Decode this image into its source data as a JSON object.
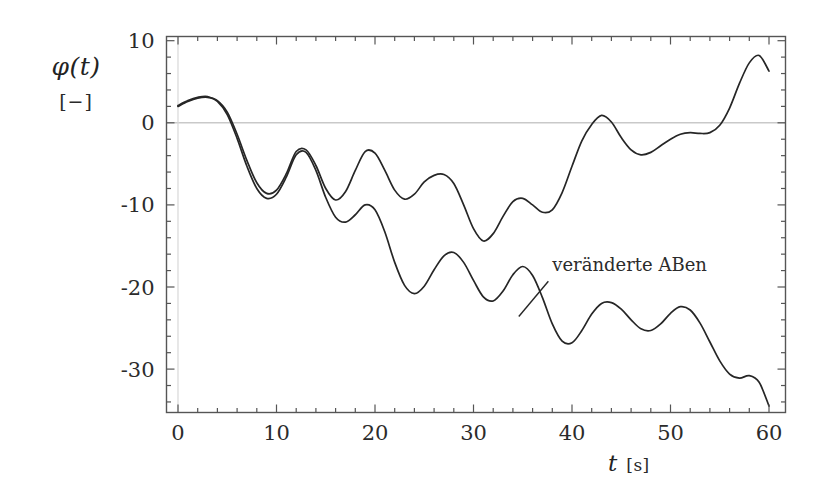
{
  "chart_data": {
    "type": "line",
    "title": "",
    "xlabel": "t",
    "xunits": "[s]",
    "ylabel": "φ(t)",
    "yunits": "[−]",
    "xlim": [
      0,
      60
    ],
    "ylim": [
      -36,
      10
    ],
    "xticks": [
      0,
      10,
      20,
      30,
      40,
      50,
      60
    ],
    "xtick_labels": [
      "0",
      "10",
      "20",
      "30",
      "40",
      "50",
      "60"
    ],
    "xminor_step": 2,
    "yticks": [
      10,
      0,
      -10,
      -20,
      -30
    ],
    "ytick_labels": [
      "10",
      "0",
      "-10",
      "-20",
      "-30"
    ],
    "yminor_step": 2,
    "grid": false,
    "zero_line": true,
    "legend_position": "none",
    "line_color": "#262626",
    "zero_line_color": "#c9c9c9",
    "frame_color": "#555555",
    "annotations": [
      {
        "text": "veränderte ABen",
        "text_x": 38.0,
        "text_y": -18.1,
        "leader_from_x": 37.6,
        "leader_from_y": -19.3,
        "leader_to_x": 34.6,
        "leader_to_y": -23.6
      }
    ],
    "series": [
      {
        "name": "original",
        "x": [
          0,
          1,
          2,
          3,
          4,
          5,
          6,
          7,
          8,
          9,
          10,
          11,
          12,
          13,
          14,
          15,
          16,
          17,
          18,
          19,
          20,
          21,
          22,
          23,
          24,
          25,
          26,
          27,
          28,
          29,
          30,
          31,
          32,
          33,
          34,
          35,
          36,
          37,
          38,
          39,
          40,
          41,
          42,
          43,
          44,
          45,
          46,
          47,
          48,
          49,
          50,
          51,
          52,
          53,
          54,
          55,
          56,
          57,
          58,
          59,
          60
        ],
        "y": [
          2.0,
          2.6,
          3.0,
          3.1,
          2.7,
          1.3,
          -1.4,
          -4.6,
          -7.3,
          -8.6,
          -8.2,
          -6.2,
          -3.5,
          -3.3,
          -5.2,
          -8.0,
          -9.4,
          -8.4,
          -5.8,
          -3.5,
          -3.7,
          -5.8,
          -8.2,
          -9.3,
          -8.7,
          -7.2,
          -6.4,
          -6.3,
          -7.4,
          -10.0,
          -12.9,
          -14.4,
          -13.5,
          -11.4,
          -9.6,
          -9.2,
          -10.0,
          -10.9,
          -10.6,
          -8.5,
          -5.3,
          -2.2,
          -0.2,
          0.9,
          0.1,
          -1.8,
          -3.3,
          -3.9,
          -3.6,
          -2.8,
          -2.0,
          -1.4,
          -1.2,
          -1.3,
          -1.2,
          -0.3,
          1.8,
          4.8,
          7.3,
          8.2,
          6.3
        ]
      },
      {
        "name": "veränderte ABen",
        "x": [
          0,
          1,
          2,
          3,
          4,
          5,
          6,
          7,
          8,
          9,
          10,
          11,
          12,
          13,
          14,
          15,
          16,
          17,
          18,
          19,
          20,
          21,
          22,
          23,
          24,
          25,
          26,
          27,
          28,
          29,
          30,
          31,
          32,
          33,
          34,
          35,
          36,
          37,
          38,
          39,
          40,
          41,
          42,
          43,
          44,
          45,
          46,
          47,
          48,
          49,
          50,
          51,
          52,
          53,
          54,
          55,
          56,
          57,
          58,
          59,
          60
        ],
        "y": [
          2.1,
          2.7,
          3.1,
          3.2,
          2.6,
          1.0,
          -1.9,
          -5.3,
          -8.0,
          -9.2,
          -8.7,
          -6.6,
          -3.9,
          -3.6,
          -5.8,
          -9.1,
          -11.5,
          -12.1,
          -11.2,
          -10.0,
          -10.6,
          -13.3,
          -17.0,
          -19.8,
          -20.8,
          -19.9,
          -17.9,
          -16.2,
          -15.8,
          -17.0,
          -19.2,
          -21.2,
          -21.7,
          -20.5,
          -18.5,
          -17.5,
          -18.6,
          -21.3,
          -24.5,
          -26.6,
          -26.8,
          -25.3,
          -23.3,
          -22.0,
          -21.9,
          -22.7,
          -24.0,
          -25.1,
          -25.3,
          -24.5,
          -23.2,
          -22.4,
          -22.8,
          -24.4,
          -26.7,
          -29.0,
          -30.6,
          -31.1,
          -30.8,
          -31.6,
          -34.5
        ]
      }
    ]
  },
  "axes": {
    "y_label_symbol": "φ(t)",
    "y_label_units": "[−]",
    "x_label_symbol": "t",
    "x_label_units": "[s]"
  }
}
